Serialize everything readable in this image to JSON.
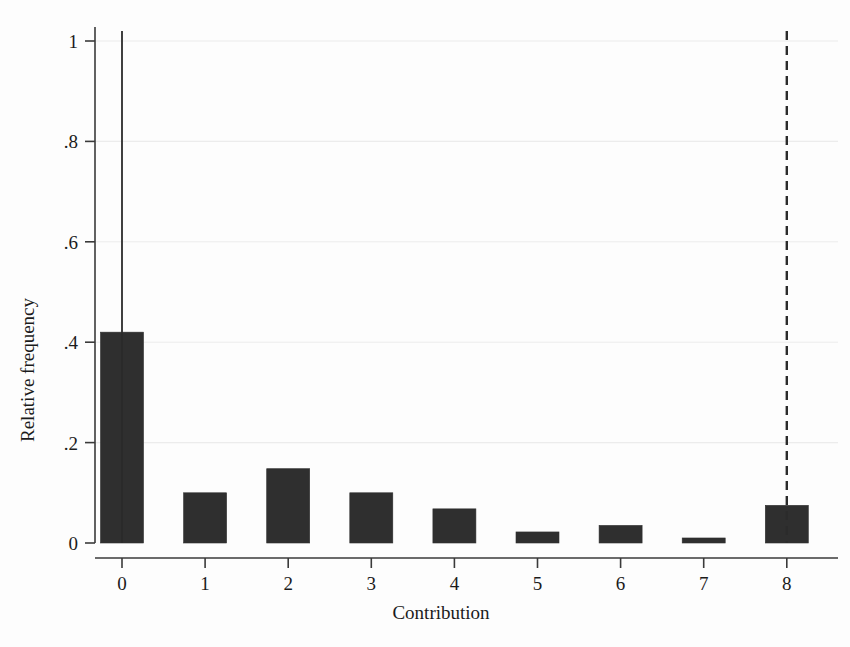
{
  "chart_data": {
    "type": "bar",
    "title": "",
    "subtitle": "",
    "xlabel": "Contribution",
    "ylabel": "Relative frequency",
    "categories": [
      "0",
      "1",
      "2",
      "3",
      "4",
      "5",
      "6",
      "7",
      "8"
    ],
    "values": [
      0.42,
      0.1,
      0.148,
      0.1,
      0.068,
      0.022,
      0.035,
      0.01,
      0.075
    ],
    "series": [
      {
        "name": "Relative frequency",
        "values": [
          0.42,
          0.1,
          0.148,
          0.1,
          0.068,
          0.022,
          0.035,
          0.01,
          0.075
        ]
      }
    ],
    "xlim": [
      -0.5,
      8.5
    ],
    "ylim": [
      0,
      1.05
    ],
    "x_tick_labels": [
      "0",
      "1",
      "2",
      "3",
      "4",
      "5",
      "6",
      "7",
      "8"
    ],
    "y_tick_labels": [
      "0",
      ".2",
      ".4",
      ".6",
      ".8",
      "1"
    ],
    "y_tick_values": [
      0,
      0.2,
      0.4,
      0.6,
      0.8,
      1
    ],
    "grid": "horizontal-faint",
    "legend": "none",
    "annotations": [
      {
        "name": "solid-reference-line",
        "kind": "vertical-line",
        "style": "solid",
        "x": 0,
        "y_top": 1.02,
        "y_bottom": 0
      },
      {
        "name": "dashed-reference-line",
        "kind": "vertical-line",
        "style": "dashed",
        "x": 8,
        "y_top": 1.02,
        "y_bottom": 0
      }
    ],
    "colors": {
      "bar_fill": "#2f2f2f",
      "bar_stroke": "#2f2f2f",
      "axis": "#3a3a3a",
      "gridline": "#ececec",
      "reference_line": "#2b2b2b",
      "background": "#fdfdfd",
      "text": "#1b1b1b"
    }
  }
}
